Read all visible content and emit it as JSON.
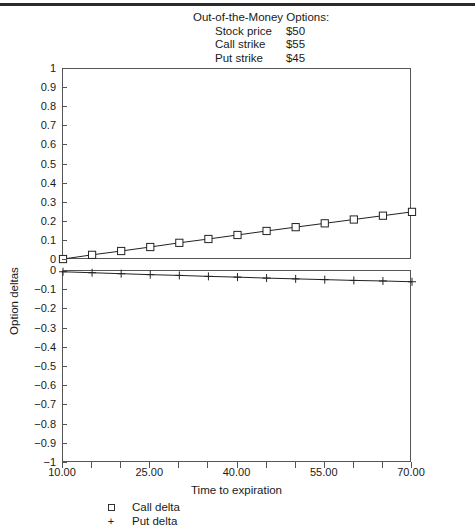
{
  "title_block": {
    "heading": "Out-of-the-Money Options:",
    "rows": [
      {
        "key": "Stock price",
        "value": "$50"
      },
      {
        "key": "Call strike",
        "value": "$55"
      },
      {
        "key": "Put strike",
        "value": "$45"
      }
    ]
  },
  "legend": {
    "items": [
      {
        "marker": "square",
        "label": "Call delta"
      },
      {
        "marker": "plus",
        "label": "Put delta"
      }
    ]
  },
  "chart_data": {
    "type": "line",
    "title": "Out-of-the-Money Options:",
    "xlabel": "Time to expiration",
    "ylabel": "Option deltas",
    "grid": false,
    "legend_position": "bottom-left",
    "panels": [
      {
        "name": "call-delta-panel",
        "ylim": [
          0,
          1
        ],
        "yticks": [
          0,
          0.1,
          0.2,
          0.3,
          0.4,
          0.5,
          0.6,
          0.7,
          0.8,
          0.9,
          1
        ],
        "yticklabels": [
          "0",
          "0.1",
          "0.2",
          "0.3",
          "0.4",
          "0.5",
          "0.6",
          "0.7",
          "0.8",
          "0.9",
          "1"
        ],
        "series": [
          {
            "name": "Call delta",
            "marker": "square",
            "x": [
              10,
              15,
              20,
              25,
              30,
              35,
              40,
              45,
              50,
              55,
              60,
              65,
              70
            ],
            "values": [
              0.005,
              0.027,
              0.047,
              0.068,
              0.09,
              0.11,
              0.131,
              0.152,
              0.172,
              0.192,
              0.212,
              0.232,
              0.252
            ]
          }
        ]
      },
      {
        "name": "put-delta-panel",
        "ylim": [
          -1,
          0
        ],
        "yticks": [
          -1,
          -0.9,
          -0.8,
          -0.7,
          -0.6,
          -0.5,
          -0.4,
          -0.3,
          -0.2,
          -0.1,
          0
        ],
        "yticklabels": [
          "−1",
          "−0.9",
          "−0.8",
          "−0.7",
          "−0.6",
          "−0.5",
          "−0.4",
          "−0.3",
          "−0.2",
          "−0.1",
          "0"
        ],
        "series": [
          {
            "name": "Put delta",
            "marker": "plus",
            "x": [
              10,
              15,
              20,
              25,
              30,
              35,
              40,
              45,
              50,
              55,
              60,
              65,
              70
            ],
            "values": [
              -0.004,
              -0.009,
              -0.014,
              -0.019,
              -0.023,
              -0.028,
              -0.032,
              -0.037,
              -0.041,
              -0.045,
              -0.049,
              -0.052,
              -0.056
            ]
          }
        ]
      }
    ],
    "xlim": [
      10,
      70
    ],
    "xticks": [
      10,
      15,
      20,
      25,
      30,
      35,
      40,
      45,
      50,
      55,
      60,
      65,
      70
    ],
    "xticklabels_shown": [
      {
        "x": 10,
        "label": "10.00"
      },
      {
        "x": 25,
        "label": "25.00"
      },
      {
        "x": 40,
        "label": "40.00"
      },
      {
        "x": 55,
        "label": "55.00"
      },
      {
        "x": 70,
        "label": "70.00"
      }
    ]
  }
}
